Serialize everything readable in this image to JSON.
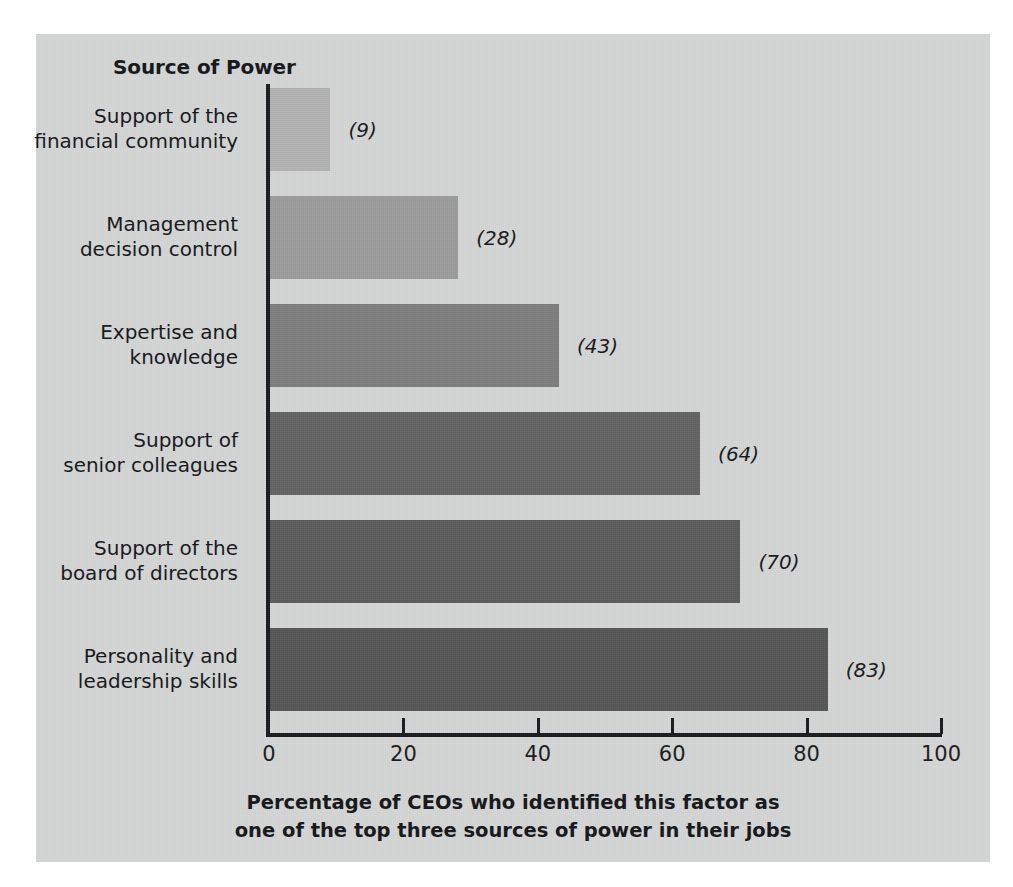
{
  "figure": {
    "background_color": "#d4d5d5",
    "page_color": "#ffffff",
    "axis_color": "#1a1b1e",
    "text_color": "#16171a"
  },
  "header": {
    "title": "Source of Power"
  },
  "chart_data": {
    "type": "bar",
    "orientation": "horizontal",
    "title": "Source of Power",
    "xlabel_line1": "Percentage of CEOs who identified this factor as",
    "xlabel_line2": "one of the top three sources of power in their jobs",
    "ylabel": "Source of Power",
    "xlim": [
      0,
      100
    ],
    "xticks": [
      0,
      20,
      40,
      60,
      80,
      100
    ],
    "xtick_labels": [
      "0",
      "20",
      "40",
      "60",
      "80",
      "100"
    ],
    "grid": false,
    "legend": false,
    "value_label_format": "(n)",
    "categories": [
      "Support of the\nfinancial community",
      "Management\ndecision control",
      "Expertise and\nknowledge",
      "Support of\nsenior colleagues",
      "Support of the\nboard of directors",
      "Personality and\nleadership skills"
    ],
    "values": [
      9,
      28,
      43,
      64,
      70,
      83
    ],
    "bar_colors": [
      "#b2b2b2",
      "#9b9b9b",
      "#7e7e7e",
      "#636363",
      "#5b5b5b",
      "#565656"
    ],
    "bars": [
      {
        "category_line1": "Support of the",
        "category_line2": "financial community",
        "value": 9,
        "value_label": "(9)",
        "color": "#b2b2b2"
      },
      {
        "category_line1": "Management",
        "category_line2": "decision control",
        "value": 28,
        "value_label": "(28)",
        "color": "#9b9b9b"
      },
      {
        "category_line1": "Expertise and",
        "category_line2": "knowledge",
        "value": 43,
        "value_label": "(43)",
        "color": "#7e7e7e"
      },
      {
        "category_line1": "Support of",
        "category_line2": "senior colleagues",
        "value": 64,
        "value_label": "(64)",
        "color": "#636363"
      },
      {
        "category_line1": "Support of the",
        "category_line2": "board of directors",
        "value": 70,
        "value_label": "(70)",
        "color": "#5b5b5b"
      },
      {
        "category_line1": "Personality and",
        "category_line2": "leadership skills",
        "value": 83,
        "value_label": "(83)",
        "color": "#565656"
      }
    ]
  }
}
